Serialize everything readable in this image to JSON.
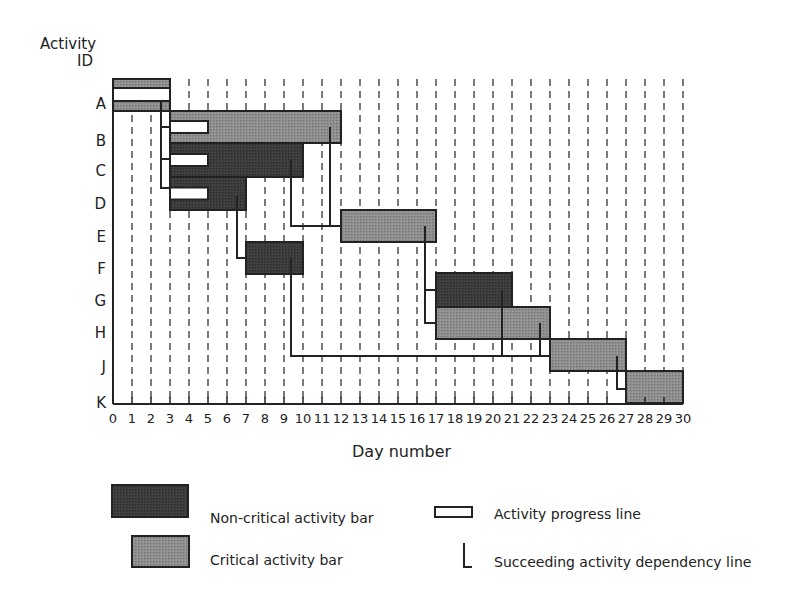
{
  "chart_data": {
    "type": "gantt",
    "title": "",
    "ylabel": "Activity ID",
    "xlabel": "Day number",
    "xlim": [
      0,
      30
    ],
    "x_ticks": [
      0,
      1,
      2,
      3,
      4,
      5,
      6,
      7,
      8,
      9,
      10,
      11,
      12,
      13,
      14,
      15,
      16,
      17,
      18,
      19,
      20,
      21,
      22,
      23,
      24,
      25,
      26,
      27,
      28,
      29,
      30
    ],
    "grid": "vertical dashed lines at each day",
    "activities": [
      {
        "id": "A",
        "start": 0,
        "end": 3,
        "type": "critical",
        "progress_line": [
          0,
          3
        ]
      },
      {
        "id": "B",
        "start": 3,
        "end": 12,
        "type": "critical",
        "progress_line": [
          3,
          5
        ]
      },
      {
        "id": "C",
        "start": 3,
        "end": 10,
        "type": "non-critical",
        "progress_line": [
          3,
          5
        ]
      },
      {
        "id": "D",
        "start": 3,
        "end": 7,
        "type": "non-critical",
        "progress_line": [
          3,
          5
        ]
      },
      {
        "id": "E",
        "start": 12,
        "end": 17,
        "type": "critical"
      },
      {
        "id": "F",
        "start": 7,
        "end": 10,
        "type": "non-critical"
      },
      {
        "id": "G",
        "start": 17,
        "end": 21,
        "type": "non-critical"
      },
      {
        "id": "H",
        "start": 17,
        "end": 23,
        "type": "critical"
      },
      {
        "id": "J",
        "start": 23,
        "end": 27,
        "type": "critical"
      },
      {
        "id": "K",
        "start": 27,
        "end": 30,
        "type": "critical"
      }
    ],
    "dependencies": [
      {
        "from": "A",
        "to": [
          "B",
          "C",
          "D"
        ]
      },
      {
        "from": "B",
        "to": [
          "E"
        ]
      },
      {
        "from": "C",
        "to": [
          "E"
        ]
      },
      {
        "from": "D",
        "to": [
          "F"
        ]
      },
      {
        "from": "E",
        "to": [
          "G",
          "H"
        ]
      },
      {
        "from": "F",
        "to": [
          "J"
        ]
      },
      {
        "from": "G",
        "to": [
          "J"
        ]
      },
      {
        "from": "H",
        "to": [
          "J"
        ]
      },
      {
        "from": "J",
        "to": [
          "K"
        ]
      }
    ],
    "legend": [
      {
        "label": "Non-critical activity bar",
        "symbol": "dark-bar"
      },
      {
        "label": "Critical activity bar",
        "symbol": "gray-bar"
      },
      {
        "label": "Activity progress line",
        "symbol": "white-box"
      },
      {
        "label": "Succeeding activity dependency line",
        "symbol": "L-line"
      }
    ]
  },
  "axis": {
    "y_title_line1": "Activity",
    "y_title_line2": "ID",
    "x_title": "Day number",
    "row_labels": [
      "A",
      "B",
      "C",
      "D",
      "E",
      "F",
      "G",
      "H",
      "J",
      "K"
    ]
  },
  "legend": {
    "noncritical": "Non-critical activity bar",
    "critical": "Critical activity bar",
    "progress": "Activity progress line",
    "dependency": "Succeeding activity dependency line"
  },
  "colors": {
    "critical": "#8c8c8c",
    "noncritical": "#3a3a3a",
    "progress": "#ffffff",
    "line": "#222222",
    "grid": "#333333"
  }
}
